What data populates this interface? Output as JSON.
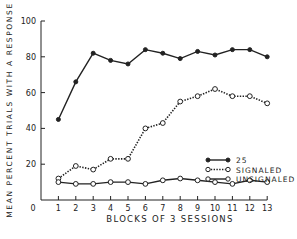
{
  "chart_data": {
    "type": "line",
    "title": "",
    "xlabel": "BLOCKS OF 3 SESSIONS",
    "ylabel": "MEAN PERCENT TRIALS WITH A RESPONSE",
    "x": [
      1,
      2,
      3,
      4,
      5,
      6,
      7,
      8,
      9,
      10,
      11,
      12,
      13
    ],
    "x_ticks": [
      "0",
      "1",
      "2",
      "3",
      "4",
      "5",
      "6",
      "7",
      "8",
      "9",
      "10",
      "11",
      "12",
      "13"
    ],
    "y_ticks": [
      "20",
      "40",
      "60",
      "80",
      "100"
    ],
    "xlim": [
      0,
      13
    ],
    "ylim": [
      0,
      100
    ],
    "grid": false,
    "legend_position": "right-middle",
    "series": [
      {
        "name": "25",
        "marker": "filled-circle",
        "line": "solid",
        "values": [
          45,
          66,
          82,
          78,
          76,
          84,
          82,
          79,
          83,
          81,
          84,
          84,
          80
        ]
      },
      {
        "name": "SIGNALED",
        "marker": "open-circle",
        "line": "dotted",
        "values": [
          12,
          19,
          17,
          23,
          23,
          40,
          43,
          55,
          58,
          62,
          58,
          58,
          54
        ]
      },
      {
        "name": "UNSIGNALED",
        "marker": "open-circle",
        "line": "solid",
        "values": [
          10,
          9,
          9,
          10,
          10,
          9,
          11,
          12,
          11,
          10,
          9,
          11,
          10
        ]
      }
    ]
  },
  "colors": {
    "ink": "#222222",
    "background": "#ffffff"
  }
}
